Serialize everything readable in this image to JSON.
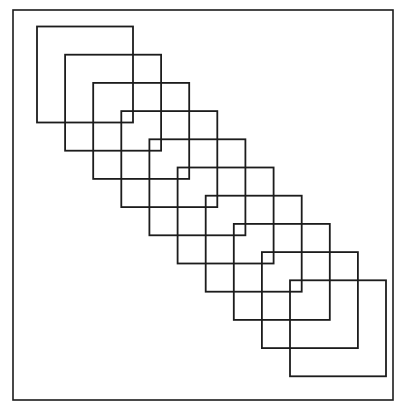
{
  "figure": {
    "title": "",
    "caption": "",
    "background_color": "#ffffff",
    "line_color": "#1c1c1c",
    "canvas": {
      "width": 407,
      "height": 418
    }
  },
  "frame": {
    "name": "outer-border",
    "x": 13,
    "y": 10,
    "width": 380,
    "height": 390,
    "stroke_width": 1.6,
    "color": "#1c1c1c"
  },
  "chart_data": {
    "type": "diagram",
    "subtype": "overlapping-squares-diagonal-cascade",
    "title": "",
    "xlabel": "",
    "ylabel": "",
    "grid": false,
    "legend": null,
    "shape_count": 10,
    "shape_size": 96,
    "step_x": 28.1,
    "step_y": 28.2,
    "first_shape_origin": [
      37,
      26.5
    ],
    "last_shape_origin": [
      290,
      280.3
    ],
    "stroke_width": 1.8,
    "stroke_color": "#1c1c1c",
    "fill": "none",
    "squares": [
      {
        "index": 1,
        "x": 37.0,
        "y": 26.5,
        "width": 96,
        "height": 96
      },
      {
        "index": 2,
        "x": 65.1,
        "y": 54.7,
        "width": 96,
        "height": 96
      },
      {
        "index": 3,
        "x": 93.2,
        "y": 82.9,
        "width": 96,
        "height": 96
      },
      {
        "index": 4,
        "x": 121.3,
        "y": 111.1,
        "width": 96,
        "height": 96
      },
      {
        "index": 5,
        "x": 149.4,
        "y": 139.3,
        "width": 96,
        "height": 96
      },
      {
        "index": 6,
        "x": 177.6,
        "y": 167.5,
        "width": 96,
        "height": 96
      },
      {
        "index": 7,
        "x": 205.7,
        "y": 195.7,
        "width": 96,
        "height": 96
      },
      {
        "index": 8,
        "x": 233.8,
        "y": 223.9,
        "width": 96,
        "height": 96
      },
      {
        "index": 9,
        "x": 261.9,
        "y": 252.1,
        "width": 96,
        "height": 96
      },
      {
        "index": 10,
        "x": 290.0,
        "y": 280.3,
        "width": 96,
        "height": 96
      }
    ]
  }
}
